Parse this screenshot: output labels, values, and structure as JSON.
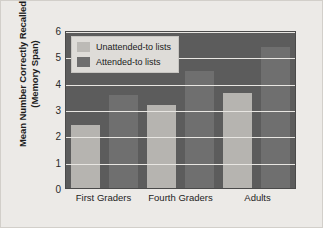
{
  "chart_data": {
    "type": "bar",
    "title": "",
    "xlabel": "",
    "ylabel": "Mean Number Correctly Recalled (Memory Span)",
    "ylabel_line1": "Mean Number Correctly Recalled",
    "ylabel_line2": "(Memory Span)",
    "categories": [
      "First Graders",
      "Fourth Graders",
      "Adults"
    ],
    "series": [
      {
        "name": "Unattended-to lists",
        "values": [
          2.4,
          3.15,
          3.6
        ],
        "color": "#b6b4b0"
      },
      {
        "name": "Attended-to lists",
        "values": [
          3.55,
          4.45,
          5.35
        ],
        "color": "#6f6f6f"
      }
    ],
    "ylim": [
      0,
      6
    ],
    "yticks": [
      6,
      5,
      4,
      3,
      2,
      1,
      0
    ],
    "grid": true,
    "legend_position": "top-left",
    "plot_background": "#5c5c5c",
    "gridline_color": "#e8e6e2",
    "figure_background": "#eceae7"
  }
}
